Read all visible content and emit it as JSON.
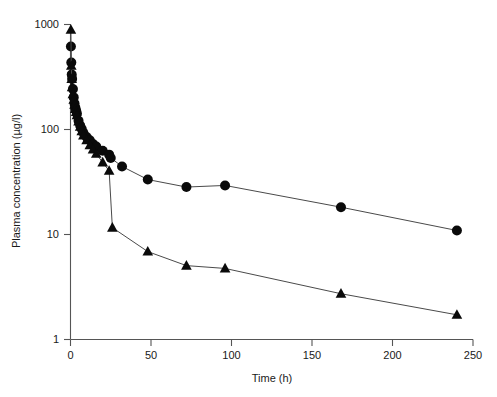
{
  "chart_data": {
    "type": "line",
    "title": "",
    "xlabel": "Time (h)",
    "ylabel": "Plasma concentration (µg/l)",
    "xlim": [
      0,
      250
    ],
    "ylim": [
      1,
      1000
    ],
    "yscale": "log",
    "xscale": "linear",
    "grid": false,
    "legend": "none",
    "xticks": [
      0,
      50,
      100,
      150,
      200,
      250
    ],
    "xticklabels": [
      "0",
      "50",
      "100",
      "150",
      "200",
      "250"
    ],
    "yticks": [
      1,
      10,
      100,
      1000
    ],
    "yticklabels": [
      "1",
      "10",
      "100",
      "1000"
    ],
    "series": [
      {
        "name": "circle-series",
        "marker": "circle",
        "x": [
          0.25,
          0.5,
          0.75,
          1,
          1.5,
          2,
          2.5,
          3,
          3.5,
          4,
          5,
          6,
          7,
          8,
          10,
          12,
          14,
          16,
          20,
          24,
          25,
          32,
          48,
          72,
          96,
          168,
          240
        ],
        "y": [
          610,
          430,
          330,
          300,
          240,
          200,
          175,
          160,
          150,
          140,
          120,
          108,
          100,
          92,
          84,
          78,
          72,
          68,
          62,
          57,
          53,
          44,
          33,
          28,
          29,
          18,
          10.8
        ]
      },
      {
        "name": "triangle-series",
        "marker": "triangle",
        "x": [
          0.25,
          0.5,
          0.75,
          1,
          1.5,
          2,
          2.5,
          3,
          3.5,
          4,
          5,
          6,
          7,
          8,
          10,
          12,
          14,
          16,
          20,
          24,
          26,
          48,
          72,
          96,
          168,
          240
        ],
        "y": [
          880,
          400,
          300,
          250,
          215,
          190,
          170,
          155,
          145,
          135,
          118,
          105,
          95,
          87,
          78,
          70,
          64,
          58,
          48,
          40,
          11.5,
          6.8,
          5.0,
          4.7,
          2.7,
          1.7
        ]
      }
    ]
  },
  "axes": {
    "x_axis_name": "time-axis",
    "y_axis_name": "concentration-axis"
  }
}
